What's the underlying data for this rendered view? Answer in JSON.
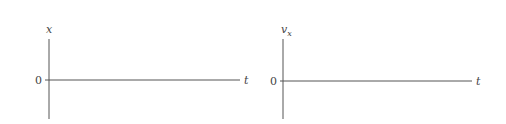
{
  "diagrams": [
    {
      "name": "position-vs-time",
      "y_label": "x",
      "x_label": "t",
      "origin_label": "0"
    },
    {
      "name": "velocity-vs-time",
      "y_label_main": "v",
      "y_label_sub": "x",
      "x_label": "t",
      "origin_label": "0"
    }
  ]
}
